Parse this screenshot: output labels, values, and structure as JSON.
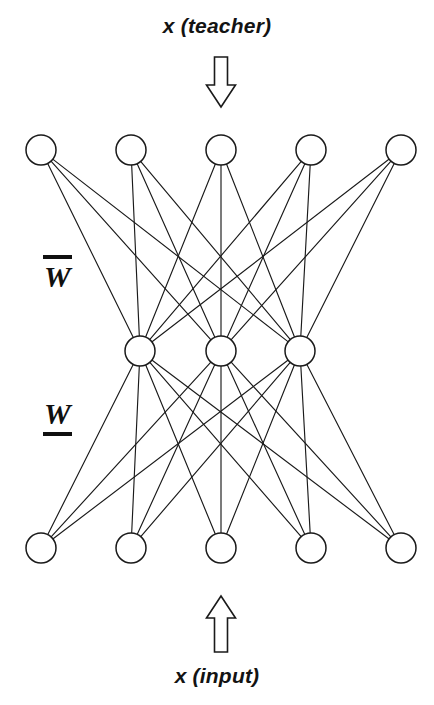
{
  "figure": {
    "type": "neural-network-diagram",
    "background_color": "#ffffff",
    "stroke_color": "#1a1a1a",
    "text_color": "#131313"
  },
  "captions": {
    "teacher": "x (teacher)",
    "input": "x (input)"
  },
  "weights": {
    "top": {
      "symbol": "W",
      "decoration": "overbar",
      "name": "W-bar"
    },
    "bottom": {
      "symbol": "W",
      "decoration": "underbar",
      "name": "W-underline"
    }
  },
  "arrows": {
    "teacher": {
      "direction": "down",
      "x": 221,
      "y_top": 57,
      "y_bottom": 107,
      "shaft_width": 13,
      "head_width": 29,
      "head_height": 22
    },
    "input": {
      "direction": "up",
      "x": 221,
      "y_top": 596,
      "y_bottom": 652,
      "shaft_width": 13,
      "head_width": 29,
      "head_height": 22
    }
  },
  "layers": [
    {
      "id": "output-layer",
      "name": "top-layer",
      "role": "teacher",
      "count": 5,
      "radius": 15,
      "y": 150,
      "nodes_x": [
        41,
        131,
        221,
        311,
        401
      ]
    },
    {
      "id": "hidden-layer",
      "name": "middle-layer",
      "role": "hidden",
      "count": 3,
      "radius": 15,
      "y": 351,
      "nodes_x": [
        140,
        221,
        300
      ]
    },
    {
      "id": "input-layer",
      "name": "bottom-layer",
      "role": "input",
      "count": 5,
      "radius": 15,
      "y": 548,
      "nodes_x": [
        41,
        131,
        221,
        311,
        401
      ]
    }
  ],
  "connections": [
    {
      "from_layer": 0,
      "to_layer": 1,
      "pattern": "fully-connected",
      "count": 15,
      "weight_label": "top"
    },
    {
      "from_layer": 1,
      "to_layer": 2,
      "pattern": "fully-connected",
      "count": 15,
      "weight_label": "bottom"
    }
  ]
}
